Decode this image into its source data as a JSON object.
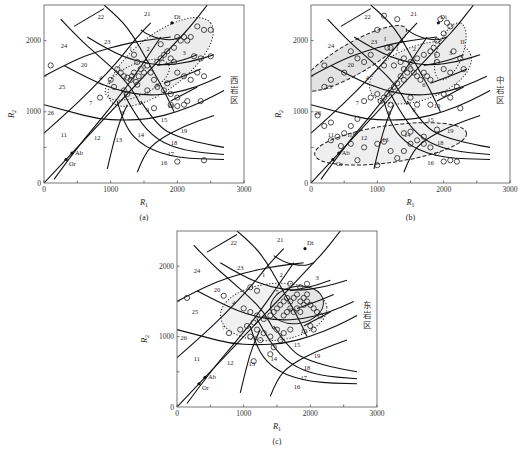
{
  "figure": {
    "type": "R1-R2 multicationic classification diagram",
    "x_axis_label": "R",
    "x_axis_subscript": "1",
    "y_axis_label": "R",
    "y_axis_subscript": "2",
    "x_ticks": [
      "0",
      "1000",
      "2000",
      "3000"
    ],
    "y_ticks": [
      "0",
      "1000",
      "2000"
    ],
    "field_labels": [
      "1",
      "2",
      "3",
      "4",
      "5",
      "6",
      "7",
      "8",
      "9",
      "10",
      "11",
      "12",
      "13",
      "14",
      "15",
      "16",
      "17",
      "18",
      "19",
      "20",
      "21",
      "22",
      "23",
      "24",
      "25",
      "26"
    ],
    "mineral_labels": [
      "Di",
      "Ab",
      "Or"
    ]
  },
  "chart_data": [
    {
      "type": "scatter",
      "panel": "(a)",
      "region_label": "西岩区",
      "xlabel": "R1",
      "ylabel": "R2",
      "xlim": [
        0,
        3000
      ],
      "ylim": [
        0,
        2500
      ],
      "grid": false,
      "envelopes": [
        "dotted ellipse around fields 1-10 (R1 900-2550, R2 1100-2300)",
        "inner dotted ellipse fields 4-6 (R1 950-1900, R2 1200-1750)"
      ],
      "points": [
        [
          100,
          1650
        ],
        [
          840,
          1200
        ],
        [
          1350,
          1800
        ],
        [
          1400,
          1700
        ],
        [
          1100,
          1600
        ],
        [
          1150,
          1550
        ],
        [
          1200,
          1500
        ],
        [
          1250,
          1480
        ],
        [
          1300,
          1450
        ],
        [
          1320,
          1500
        ],
        [
          1350,
          1550
        ],
        [
          1380,
          1420
        ],
        [
          1400,
          1380
        ],
        [
          1420,
          1500
        ],
        [
          1450,
          1600
        ],
        [
          1500,
          1550
        ],
        [
          1550,
          1650
        ],
        [
          1600,
          1550
        ],
        [
          1650,
          1450
        ],
        [
          1700,
          1700
        ],
        [
          1750,
          1750
        ],
        [
          1800,
          1800
        ],
        [
          1850,
          1850
        ],
        [
          1900,
          1750
        ],
        [
          1950,
          1700
        ],
        [
          2000,
          2050
        ],
        [
          2050,
          2000
        ],
        [
          2100,
          2050
        ],
        [
          2150,
          2000
        ],
        [
          2200,
          2050
        ],
        [
          2300,
          2200
        ],
        [
          2400,
          2150
        ],
        [
          2500,
          2150
        ],
        [
          2250,
          1780
        ],
        [
          2350,
          1750
        ],
        [
          2500,
          1780
        ],
        [
          2000,
          1550
        ],
        [
          2100,
          1500
        ],
        [
          2200,
          1450
        ],
        [
          2300,
          1550
        ],
        [
          2400,
          1500
        ],
        [
          1700,
          1350
        ],
        [
          1800,
          1300
        ],
        [
          1900,
          1250
        ],
        [
          2000,
          1200
        ],
        [
          1900,
          1100
        ],
        [
          2000,
          1080
        ],
        [
          2100,
          1100
        ],
        [
          2150,
          1150
        ],
        [
          1650,
          1050
        ],
        [
          1250,
          1250
        ],
        [
          1050,
          1350
        ],
        [
          1000,
          1450
        ],
        [
          1200,
          1300
        ],
        [
          1550,
          1300
        ],
        [
          1850,
          1400
        ],
        [
          1950,
          1900
        ],
        [
          1750,
          1950
        ],
        [
          2350,
          1150
        ],
        [
          2000,
          300
        ],
        [
          2400,
          320
        ]
      ]
    },
    {
      "type": "scatter",
      "panel": "(b)",
      "region_label": "中岩区",
      "xlabel": "R1",
      "ylabel": "R2",
      "xlim": [
        0,
        3000
      ],
      "ylim": [
        0,
        2500
      ],
      "grid": false,
      "group_labels": [
        "I",
        "II",
        "III"
      ],
      "envelopes": [
        "I: shaded dashed band fields 20-25 (upper-left)",
        "II: shaded dotted envelope fields 2-10 (upper-right)",
        "III: shaded dashed band fields 11-17 (lower)"
      ],
      "points": [
        [
          1100,
          2350
        ],
        [
          1300,
          2300
        ],
        [
          1000,
          2150
        ],
        [
          1150,
          1900
        ],
        [
          1200,
          1900
        ],
        [
          900,
          1800
        ],
        [
          700,
          1750
        ],
        [
          800,
          1700
        ],
        [
          500,
          1550
        ],
        [
          300,
          1450
        ],
        [
          200,
          1350
        ],
        [
          600,
          1850
        ],
        [
          200,
          1650
        ],
        [
          1100,
          1650
        ],
        [
          1250,
          1650
        ],
        [
          1350,
          1700
        ],
        [
          1400,
          1600
        ],
        [
          1450,
          1550
        ],
        [
          1500,
          1600
        ],
        [
          1550,
          1550
        ],
        [
          1600,
          1500
        ],
        [
          1650,
          1450
        ],
        [
          1700,
          1550
        ],
        [
          1750,
          1500
        ],
        [
          1800,
          1450
        ],
        [
          1400,
          1450
        ],
        [
          1350,
          1500
        ],
        [
          1300,
          1400
        ],
        [
          1250,
          1350
        ],
        [
          1200,
          1300
        ],
        [
          1150,
          1250
        ],
        [
          1100,
          1200
        ],
        [
          1000,
          1250
        ],
        [
          900,
          1200
        ],
        [
          800,
          1150
        ],
        [
          1050,
          1150
        ],
        [
          1200,
          1100
        ],
        [
          1500,
          1200
        ],
        [
          1600,
          1100
        ],
        [
          1800,
          1100
        ],
        [
          2000,
          1250
        ],
        [
          2100,
          1200
        ],
        [
          2200,
          1350
        ],
        [
          2100,
          1550
        ],
        [
          2000,
          1600
        ],
        [
          1900,
          1700
        ],
        [
          1850,
          1900
        ],
        [
          1900,
          2000
        ],
        [
          2000,
          2100
        ],
        [
          2050,
          2250
        ],
        [
          2100,
          2200
        ],
        [
          1950,
          2300
        ],
        [
          2150,
          1850
        ],
        [
          2250,
          1750
        ],
        [
          2300,
          1600
        ],
        [
          2250,
          1050
        ],
        [
          1900,
          1800
        ],
        [
          1800,
          1850
        ],
        [
          1700,
          1800
        ],
        [
          1600,
          1750
        ],
        [
          1500,
          1700
        ],
        [
          1400,
          1750
        ],
        [
          100,
          950
        ],
        [
          200,
          800
        ],
        [
          300,
          850
        ],
        [
          400,
          650
        ],
        [
          500,
          700
        ],
        [
          600,
          800
        ],
        [
          700,
          900
        ],
        [
          300,
          600
        ],
        [
          450,
          520
        ],
        [
          600,
          550
        ],
        [
          800,
          500
        ],
        [
          1000,
          550
        ],
        [
          1100,
          580
        ],
        [
          1200,
          450
        ],
        [
          1300,
          350
        ],
        [
          1400,
          450
        ],
        [
          1500,
          550
        ],
        [
          1600,
          600
        ],
        [
          1700,
          550
        ],
        [
          1800,
          500
        ],
        [
          1700,
          650
        ],
        [
          1500,
          720
        ],
        [
          1400,
          700
        ],
        [
          1900,
          750
        ],
        [
          2000,
          300
        ],
        [
          2100,
          320
        ],
        [
          2200,
          300
        ],
        [
          1000,
          250
        ],
        [
          700,
          320
        ]
      ]
    },
    {
      "type": "scatter",
      "panel": "(c)",
      "region_label": "东岩区",
      "xlabel": "R1",
      "ylabel": "R2",
      "xlim": [
        0,
        3000
      ],
      "ylim": [
        0,
        2500
      ],
      "grid": false,
      "envelopes": [
        "dotted ellipse fields 4-10 (R1 750-2200, R2 900-1850)",
        "inner shaded ellipse fields 5-6 (R1 1500-2150, R2 1250-1700)"
      ],
      "points": [
        [
          150,
          1550
        ],
        [
          700,
          1580
        ],
        [
          780,
          1050
        ],
        [
          1100,
          1700
        ],
        [
          1200,
          1650
        ],
        [
          1000,
          1400
        ],
        [
          1100,
          1350
        ],
        [
          1200,
          1300
        ],
        [
          1300,
          1250
        ],
        [
          1150,
          1200
        ],
        [
          1050,
          1150
        ],
        [
          950,
          1100
        ],
        [
          1200,
          1100
        ],
        [
          1300,
          1050
        ],
        [
          1100,
          1000
        ],
        [
          1250,
          950
        ],
        [
          1400,
          1300
        ],
        [
          1450,
          1350
        ],
        [
          1500,
          1400
        ],
        [
          1550,
          1450
        ],
        [
          1600,
          1500
        ],
        [
          1650,
          1550
        ],
        [
          1700,
          1500
        ],
        [
          1750,
          1550
        ],
        [
          1800,
          1600
        ],
        [
          1850,
          1500
        ],
        [
          1900,
          1450
        ],
        [
          1950,
          1500
        ],
        [
          1700,
          1400
        ],
        [
          1650,
          1350
        ],
        [
          1600,
          1300
        ],
        [
          1750,
          1350
        ],
        [
          1800,
          1400
        ],
        [
          1850,
          1350
        ],
        [
          1900,
          1550
        ],
        [
          1950,
          1600
        ],
        [
          2000,
          1450
        ],
        [
          2050,
          1400
        ],
        [
          2100,
          1350
        ],
        [
          2150,
          1300
        ],
        [
          1700,
          1750
        ],
        [
          1850,
          1700
        ],
        [
          1950,
          1750
        ],
        [
          2000,
          1150
        ],
        [
          2050,
          1100
        ],
        [
          1500,
          1100
        ],
        [
          1600,
          1050
        ],
        [
          1700,
          1100
        ],
        [
          1400,
          1000
        ],
        [
          1550,
          950
        ],
        [
          1450,
          850
        ],
        [
          1400,
          750
        ],
        [
          1150,
          650
        ]
      ]
    }
  ],
  "panels": [
    {
      "caption": "(a)",
      "side_label": "西岩区"
    },
    {
      "caption": "(b)",
      "side_label": "中岩区"
    },
    {
      "caption": "(c)",
      "side_label": "东岩区"
    }
  ]
}
